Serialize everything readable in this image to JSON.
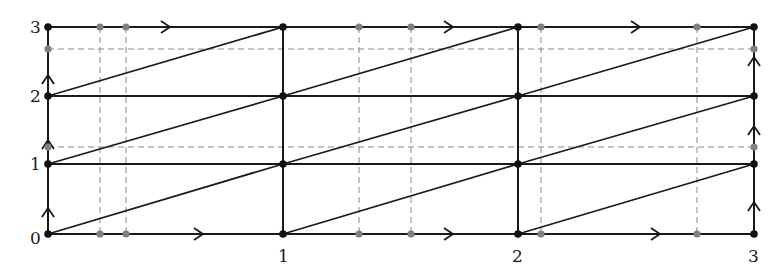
{
  "diagram": {
    "type": "grid-torus-line-diagram",
    "grid": {
      "cols": 3,
      "rows": 3
    },
    "x_axis_labels": [
      "0",
      "1",
      "2",
      "3"
    ],
    "y_axis_labels": [
      "0",
      "1",
      "2",
      "3"
    ],
    "colors": {
      "line": "#1a1a1a",
      "dashed": "#8a8a8a",
      "vertex": "#111111",
      "gray_point": "#808080"
    },
    "pixel_geometry": {
      "x_cols": [
        48,
        283,
        518,
        754
      ],
      "y_rows": [
        234,
        164,
        96,
        27
      ],
      "dashed_horizontal_y": [
        49,
        147
      ],
      "dashed_vertical_x": [
        100,
        126,
        359,
        411,
        541,
        697
      ]
    },
    "diagonals": [
      {
        "from": [
          0,
          0
        ],
        "to": [
          1,
          1
        ]
      },
      {
        "from": [
          1,
          0
        ],
        "to": [
          2,
          1
        ]
      },
      {
        "from": [
          2,
          0
        ],
        "to": [
          3,
          1
        ]
      },
      {
        "from": [
          0,
          1
        ],
        "to": [
          1,
          2
        ]
      },
      {
        "from": [
          1,
          1
        ],
        "to": [
          2,
          2
        ]
      },
      {
        "from": [
          2,
          1
        ],
        "to": [
          3,
          2
        ]
      },
      {
        "from": [
          0,
          2
        ],
        "to": [
          1,
          3
        ]
      },
      {
        "from": [
          1,
          2
        ],
        "to": [
          2,
          3
        ]
      },
      {
        "from": [
          2,
          2
        ],
        "to": [
          3,
          3
        ]
      }
    ],
    "arrows": {
      "horizontal_bottom": [
        [
          203,
          234
        ],
        [
          453,
          234
        ],
        [
          660,
          234
        ]
      ],
      "horizontal_top": [
        [
          170,
          27
        ],
        [
          453,
          27
        ],
        [
          640,
          27
        ]
      ],
      "vertical_left": [
        [
          48,
          208
        ],
        [
          48,
          140
        ],
        [
          48,
          75
        ]
      ],
      "vertical_right": [
        [
          754,
          202
        ],
        [
          754,
          126
        ],
        [
          754,
          57
        ]
      ]
    },
    "gray_points": [
      [
        100,
        27
      ],
      [
        126,
        27
      ],
      [
        359,
        27
      ],
      [
        411,
        27
      ],
      [
        541,
        27
      ],
      [
        697,
        27
      ],
      [
        100,
        234
      ],
      [
        126,
        234
      ],
      [
        359,
        234
      ],
      [
        411,
        234
      ],
      [
        541,
        234
      ],
      [
        697,
        234
      ],
      [
        48,
        49
      ],
      [
        48,
        147
      ],
      [
        754,
        49
      ],
      [
        754,
        147
      ]
    ]
  }
}
